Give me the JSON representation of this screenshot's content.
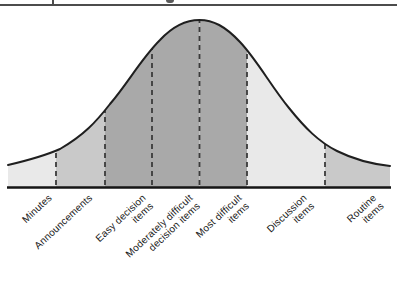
{
  "top_crop": {
    "rule_color": "#4c4c4c",
    "fragment_color": "#5a5a5a"
  },
  "diagram": {
    "type": "bell-curve",
    "baseline_y": 187,
    "colors": {
      "light": "#e9e9e9",
      "medium": "#c9c9c9",
      "dark": "#a9a9a9",
      "stroke": "#1f1f1f",
      "dashed": "#3a3a3a",
      "baseline": "#151515",
      "label_text": "#1a1a1a"
    },
    "segments": [
      {
        "label": "Minutes",
        "shade": "light",
        "x0": 8,
        "x1": 56,
        "anchor_x": 46
      },
      {
        "label": "Announcements",
        "shade": "medium",
        "x0": 56,
        "x1": 105,
        "anchor_x": 87
      },
      {
        "label": "Easy decision\nitems",
        "shade": "dark",
        "x0": 105,
        "x1": 152,
        "anchor_x": 140
      },
      {
        "label": "Moderately difficult\ndecision items",
        "shade": "dark",
        "x0": 152,
        "x1": 199.5,
        "anchor_x": 187
      },
      {
        "label": "Most difficult\nitems",
        "shade": "dark",
        "x0": 199.5,
        "x1": 247,
        "anchor_x": 236
      },
      {
        "label": "Discussion\nitems",
        "shade": "light",
        "x0": 247,
        "x1": 325,
        "anchor_x": 301
      },
      {
        "label": "Routine\nitems",
        "shade": "medium",
        "x0": 325,
        "x1": 390,
        "anchor_x": 371
      }
    ]
  }
}
